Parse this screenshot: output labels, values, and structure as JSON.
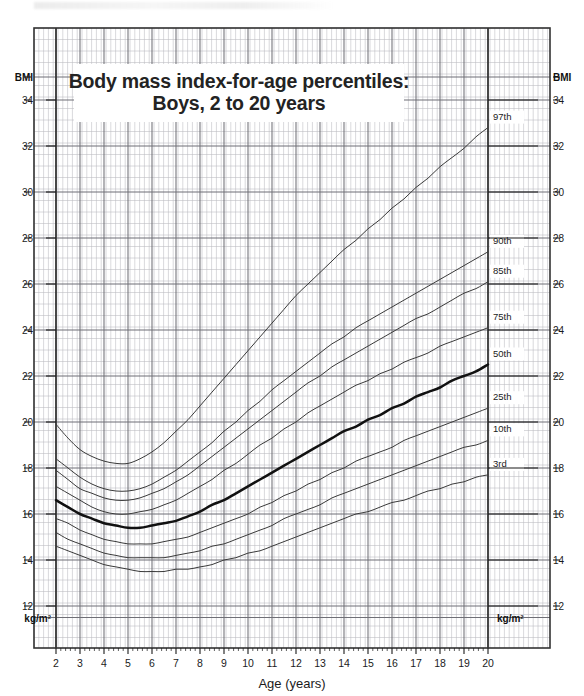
{
  "title": {
    "line1": "Body mass index-for-age percentiles:",
    "line2": "Boys, 2 to 20 years"
  },
  "axes": {
    "y_unit_top_left": "BMI",
    "y_unit_top_right": "BMI",
    "y_unit_bottom_left": "kg/m²",
    "y_unit_bottom_right": "kg/m²",
    "x_title": "Age (years)",
    "y_ticks": [
      34,
      32,
      30,
      28,
      26,
      24,
      22,
      20,
      18,
      16,
      14,
      12
    ],
    "x_ticks": [
      2,
      3,
      4,
      5,
      6,
      7,
      8,
      9,
      10,
      11,
      12,
      13,
      14,
      15,
      16,
      17,
      18,
      19,
      20
    ]
  },
  "percentile_labels": [
    "97th",
    "90th",
    "85th",
    "75th",
    "50th",
    "25th",
    "10th",
    "3rd"
  ],
  "colors": {
    "curve": "#3a3a3a",
    "curve_bold": "#111111",
    "grid_minor": "#b9b9bf",
    "grid_major": "#6f6f76",
    "frame": "#333333",
    "text": "#1b1b1b",
    "title_text": "#232323",
    "background": "#ffffff"
  },
  "chart_data": {
    "type": "line",
    "title": "Body mass index-for-age percentiles: Boys, 2 to 20 years",
    "xlabel": "Age (years)",
    "ylabel": "BMI",
    "y_unit": "kg/m²",
    "xlim": [
      2,
      20
    ],
    "ylim": [
      11.2,
      35.2
    ],
    "grid": true,
    "legend": "right-edge-curve-labels",
    "x": [
      2,
      2.5,
      3,
      3.5,
      4,
      4.5,
      5,
      5.5,
      6,
      6.5,
      7,
      7.5,
      8,
      8.5,
      9,
      9.5,
      10,
      10.5,
      11,
      11.5,
      12,
      12.5,
      13,
      13.5,
      14,
      14.5,
      15,
      15.5,
      16,
      16.5,
      17,
      17.5,
      18,
      18.5,
      19,
      19.5,
      20
    ],
    "series": [
      {
        "name": "97th",
        "values": [
          19.9,
          19.3,
          18.8,
          18.5,
          18.3,
          18.2,
          18.2,
          18.4,
          18.7,
          19.1,
          19.6,
          20.1,
          20.7,
          21.3,
          21.9,
          22.5,
          23.1,
          23.7,
          24.3,
          24.9,
          25.5,
          26.0,
          26.5,
          27.0,
          27.5,
          27.9,
          28.4,
          28.8,
          29.3,
          29.7,
          30.2,
          30.6,
          31.1,
          31.5,
          31.9,
          32.4,
          32.8
        ]
      },
      {
        "name": "90th",
        "values": [
          18.4,
          18.0,
          17.6,
          17.3,
          17.1,
          17.0,
          17.0,
          17.1,
          17.3,
          17.6,
          17.9,
          18.3,
          18.7,
          19.1,
          19.6,
          20.0,
          20.5,
          20.9,
          21.4,
          21.8,
          22.2,
          22.6,
          23.0,
          23.4,
          23.7,
          24.1,
          24.4,
          24.7,
          25.0,
          25.3,
          25.6,
          25.9,
          26.2,
          26.5,
          26.8,
          27.1,
          27.4
        ]
      },
      {
        "name": "85th",
        "values": [
          17.9,
          17.5,
          17.1,
          16.9,
          16.7,
          16.6,
          16.6,
          16.7,
          16.9,
          17.1,
          17.4,
          17.7,
          18.1,
          18.5,
          18.9,
          19.3,
          19.7,
          20.1,
          20.5,
          20.9,
          21.3,
          21.7,
          22.0,
          22.4,
          22.7,
          23.0,
          23.3,
          23.6,
          23.9,
          24.2,
          24.5,
          24.7,
          25.0,
          25.3,
          25.6,
          25.8,
          26.1
        ]
      },
      {
        "name": "75th",
        "values": [
          17.2,
          16.9,
          16.6,
          16.3,
          16.1,
          16.0,
          16.0,
          16.1,
          16.2,
          16.4,
          16.6,
          16.9,
          17.2,
          17.5,
          17.9,
          18.2,
          18.6,
          19.0,
          19.3,
          19.7,
          20.0,
          20.4,
          20.7,
          21.0,
          21.3,
          21.6,
          21.8,
          22.1,
          22.3,
          22.6,
          22.8,
          23.0,
          23.3,
          23.5,
          23.7,
          23.9,
          24.1
        ]
      },
      {
        "name": "50th",
        "values": [
          16.6,
          16.3,
          16.0,
          15.8,
          15.6,
          15.5,
          15.4,
          15.4,
          15.5,
          15.6,
          15.7,
          15.9,
          16.1,
          16.4,
          16.6,
          16.9,
          17.2,
          17.5,
          17.8,
          18.1,
          18.4,
          18.7,
          19.0,
          19.3,
          19.6,
          19.8,
          20.1,
          20.3,
          20.6,
          20.8,
          21.1,
          21.3,
          21.5,
          21.8,
          22.0,
          22.2,
          22.5
        ]
      },
      {
        "name": "25th",
        "values": [
          15.8,
          15.6,
          15.3,
          15.1,
          14.9,
          14.8,
          14.7,
          14.7,
          14.7,
          14.8,
          14.9,
          15.0,
          15.2,
          15.4,
          15.6,
          15.8,
          16.0,
          16.3,
          16.5,
          16.8,
          17.0,
          17.3,
          17.5,
          17.8,
          18.0,
          18.3,
          18.5,
          18.7,
          18.9,
          19.2,
          19.4,
          19.6,
          19.8,
          20.0,
          20.2,
          20.4,
          20.6
        ]
      },
      {
        "name": "10th",
        "values": [
          15.2,
          14.9,
          14.7,
          14.5,
          14.3,
          14.2,
          14.1,
          14.1,
          14.1,
          14.1,
          14.2,
          14.3,
          14.4,
          14.6,
          14.7,
          14.9,
          15.1,
          15.3,
          15.5,
          15.8,
          16.0,
          16.2,
          16.4,
          16.7,
          16.9,
          17.1,
          17.3,
          17.5,
          17.7,
          17.9,
          18.1,
          18.3,
          18.5,
          18.7,
          18.9,
          19.0,
          19.2
        ]
      },
      {
        "name": "3rd",
        "values": [
          14.6,
          14.4,
          14.2,
          14.0,
          13.8,
          13.7,
          13.6,
          13.5,
          13.5,
          13.5,
          13.6,
          13.6,
          13.7,
          13.8,
          14.0,
          14.1,
          14.3,
          14.4,
          14.6,
          14.8,
          15.0,
          15.2,
          15.4,
          15.6,
          15.8,
          16.0,
          16.1,
          16.3,
          16.5,
          16.6,
          16.8,
          17.0,
          17.1,
          17.3,
          17.4,
          17.6,
          17.7
        ]
      }
    ]
  }
}
